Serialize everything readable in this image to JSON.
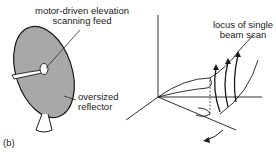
{
  "figure": {
    "panel_label": "(b)",
    "labels": {
      "feed_line1": "motor-driven elevation",
      "feed_line2": "scanning feed",
      "reflector_line1": "oversized",
      "reflector_line2": "reflector",
      "locus_line1": "locus of single",
      "locus_line2": "beam scan"
    },
    "colors": {
      "reflector_fill": "#a8a8a8",
      "stroke": "#1a1a1a",
      "background": "#ffffff"
    }
  }
}
